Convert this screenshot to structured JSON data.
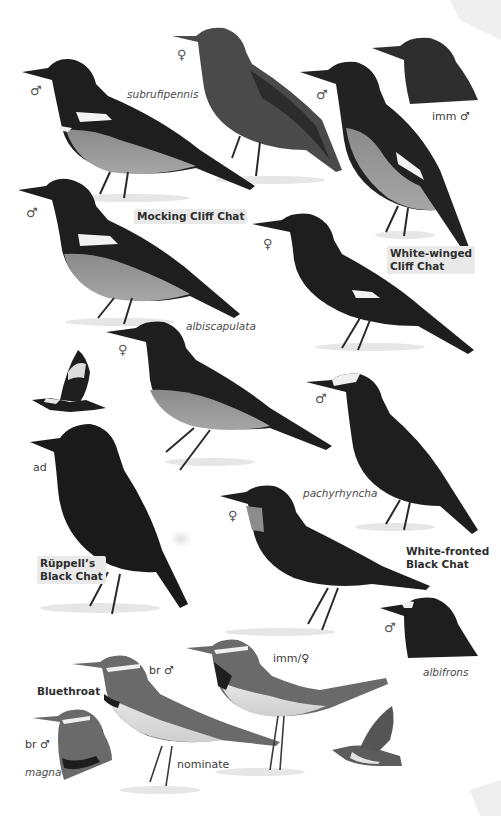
{
  "plate": {
    "background_color": "#ffffff",
    "ink_color": "#1e1e1e",
    "labels": {
      "mock_male_top_sym": "♂",
      "subrufipennis": "subrufipennis",
      "mock_female_top_sym": "♀",
      "wwcc_male_sym": "♂",
      "imm_male": "imm ♂",
      "mock_male_mid_sym": "♂",
      "mocking_cliff_chat": "Mocking Cliff Chat",
      "wwcc_female_sym": "♀",
      "white_winged_cliff_chat_1": "White-winged",
      "white_winged_cliff_chat_2": "Cliff Chat",
      "albiscapulata": "albiscapulata",
      "albiscapulata_female_sym": "♀",
      "wfbc_male_sym": "♂",
      "ad": "ad",
      "ruppells_1": "Rüppell’s",
      "ruppells_2": "Black Chat",
      "pachyrhyncha": "pachyrhyncha",
      "wfbc_female_sym": "♀",
      "white_fronted_1": "White-fronted",
      "white_fronted_2": "Black Chat",
      "albifrons_male_sym": "♂",
      "albifrons": "albifrons",
      "bluethroat": "Bluethroat",
      "br_male_nominate": "br ♂",
      "imm_female": "imm/♀",
      "br_male_magna": "br ♂",
      "magna": "magna",
      "nominate": "nominate"
    }
  }
}
